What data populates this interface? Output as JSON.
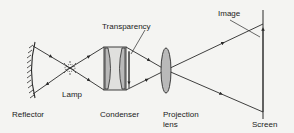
{
  "diagram": {
    "components": [
      {
        "id": "reflector",
        "label": "Reflector"
      },
      {
        "id": "lamp",
        "label": "Lamp"
      },
      {
        "id": "condenser",
        "label": "Condenser"
      },
      {
        "id": "transparency",
        "label": "Transparency"
      },
      {
        "id": "projection_lens",
        "label_line1": "Projection",
        "label_line2": "lens"
      },
      {
        "id": "image",
        "label": "Image"
      },
      {
        "id": "screen",
        "label": "Screen"
      }
    ],
    "colors": {
      "line": "#2a2a2a",
      "lens_fill": "#b9b9b9",
      "background": "#f4f4f2"
    }
  }
}
